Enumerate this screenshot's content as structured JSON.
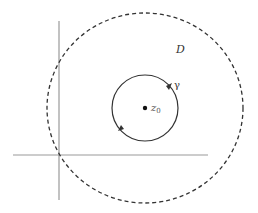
{
  "figure": {
    "labels": {
      "domain": "D",
      "curve": "γ",
      "point": "z",
      "point_subscript": "0"
    },
    "colors": {
      "axis": "#999999",
      "circle": "#333333",
      "dashed_circle": "#333333",
      "text": "#333333"
    },
    "axes": {
      "horizontal": {
        "x1": 13,
        "x2": 208,
        "y": 155
      },
      "vertical": {
        "x": 59,
        "y1": 21,
        "y2": 200
      }
    },
    "domain_circle": {
      "cx": 145,
      "cy": 108,
      "rx": 98,
      "ry": 95,
      "style": "dashed"
    },
    "gamma_circle": {
      "cx": 145,
      "cy": 108,
      "r": 33,
      "orientation": "counterclockwise"
    },
    "center_point": {
      "x": 145,
      "y": 108
    }
  }
}
